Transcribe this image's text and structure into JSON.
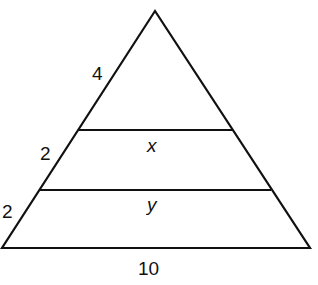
{
  "diagram": {
    "shape": "triangle with two segments parallel to the base",
    "labels": {
      "left_upper": "4",
      "left_middle": "2",
      "left_lower": "2",
      "segment_upper": "x",
      "segment_lower": "y",
      "base": "10"
    },
    "colors": {
      "stroke": "#111111",
      "background": "#ffffff"
    }
  }
}
